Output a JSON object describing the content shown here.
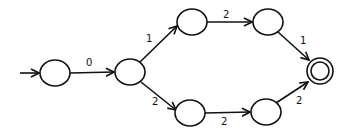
{
  "diagram": {
    "type": "finite-state-automaton",
    "states": [
      {
        "id": "s0",
        "cx": 55,
        "cy": 73,
        "start": true,
        "accepting": false
      },
      {
        "id": "s1",
        "cx": 130,
        "cy": 72,
        "start": false,
        "accepting": false
      },
      {
        "id": "s2",
        "cx": 192,
        "cy": 22,
        "start": false,
        "accepting": false
      },
      {
        "id": "s3",
        "cx": 268,
        "cy": 22,
        "start": false,
        "accepting": false
      },
      {
        "id": "s4",
        "cx": 190,
        "cy": 113,
        "start": false,
        "accepting": false
      },
      {
        "id": "s5",
        "cx": 266,
        "cy": 112,
        "start": false,
        "accepting": false
      },
      {
        "id": "s6",
        "cx": 320,
        "cy": 71,
        "start": false,
        "accepting": true
      }
    ],
    "transitions": [
      {
        "from": "s0",
        "to": "s1",
        "label": "0"
      },
      {
        "from": "s1",
        "to": "s2",
        "label": "1"
      },
      {
        "from": "s1",
        "to": "s4",
        "label": "2"
      },
      {
        "from": "s2",
        "to": "s3",
        "label": "2"
      },
      {
        "from": "s4",
        "to": "s5",
        "label": "2"
      },
      {
        "from": "s3",
        "to": "s6",
        "label": "1"
      },
      {
        "from": "s5",
        "to": "s6",
        "label": "2"
      }
    ]
  }
}
